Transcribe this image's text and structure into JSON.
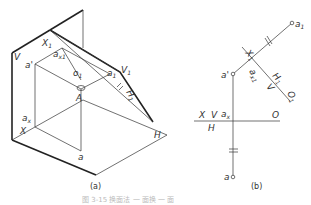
{
  "figure": {
    "caption": "图 3-15 换面法 一 面换 一 面",
    "panel_a": {
      "label": "(a)",
      "labels": {
        "V": "V",
        "X1": "X",
        "X1_sub": "1",
        "ax1": "a",
        "ax1_sub": "x1",
        "a_prime": "a'",
        "o1": "o",
        "o1_sub": "1",
        "a1": "a",
        "a1_sub": "1",
        "V1": "V",
        "V1_sub": "1",
        "H1": "H",
        "H1_sub": "1",
        "A": "A",
        "ax": "a",
        "ax_sub": "x",
        "X": "X",
        "a": "a",
        "H": "H"
      }
    },
    "panel_b": {
      "label": "(b)",
      "labels": {
        "a1": "a",
        "a1_sub": "1",
        "X1": "X",
        "X1_sub": "1",
        "a_prime": "a'",
        "ax1": "a",
        "ax1_sub": "x1",
        "H1": "H",
        "H1_sub": "1",
        "V": "V",
        "O1": "O",
        "O1_sub": "1",
        "X": "X",
        "V2": "V",
        "ax": "a",
        "ax_sub": "x",
        "O": "O",
        "H": "H",
        "a": "a"
      }
    }
  }
}
